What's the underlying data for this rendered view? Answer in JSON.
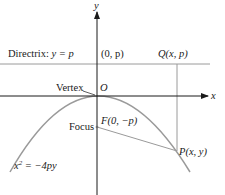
{
  "diagram": {
    "type": "parabola-directrix-focus",
    "colors": {
      "axis": "#1a1a1a",
      "curve": "#9a9a9a",
      "guide": "#9a9a9a",
      "text": "#1a1a1a"
    },
    "axes": {
      "x_label": "x",
      "y_label": "y",
      "origin_label": "O"
    },
    "directrix": {
      "label_prefix": "Directrix: ",
      "label_eq": "y = p",
      "point_label": "(0, p)"
    },
    "points": {
      "Q": "Q(x, p)",
      "P": "P(x, y)",
      "F": "F(0, −p)"
    },
    "annotations": {
      "vertex": "Vertex",
      "focus": "Focus"
    },
    "equation": {
      "base": "x",
      "exp": "2",
      "rest": " = −4py"
    }
  }
}
